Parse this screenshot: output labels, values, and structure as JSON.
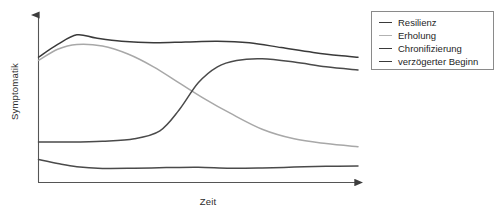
{
  "chart_data": {
    "type": "line",
    "title": "",
    "xlabel": "Zeit",
    "ylabel": "Symptomatik",
    "grid": false,
    "legend_position": "right-top",
    "axis_style": "arrow-axes-no-ticks",
    "xlim": [
      0,
      100
    ],
    "ylim": [
      0,
      100
    ],
    "series": [
      {
        "name": "Resilienz",
        "color": "#4a4a4a",
        "description": "low flat curve near baseline, slight decline then flat",
        "x": [
          0,
          6,
          12,
          20,
          30,
          40,
          50,
          60,
          70,
          80,
          90,
          100
        ],
        "y": [
          14,
          11.5,
          9.5,
          8.5,
          8.6,
          9.0,
          9.2,
          8.6,
          8.8,
          9.3,
          9.8,
          10.0
        ]
      },
      {
        "name": "Erholung",
        "color": "#a8a8a8",
        "description": "rises to early peak then steadily declines to low level",
        "x": [
          0,
          6,
          12,
          20,
          28,
          36,
          44,
          52,
          60,
          70,
          80,
          90,
          100
        ],
        "y": [
          76,
          83,
          86,
          85,
          80,
          72,
          62,
          52,
          43,
          33,
          27,
          24,
          22
        ]
      },
      {
        "name": "Chronifizierung",
        "color": "#3a3a3a",
        "description": "rises to high early peak and remains elevated with slight decline",
        "x": [
          0,
          6,
          12,
          18,
          26,
          36,
          46,
          56,
          66,
          76,
          86,
          94,
          100
        ],
        "y": [
          78,
          86,
          92,
          90,
          88,
          87,
          87.5,
          88,
          87,
          84,
          81,
          79,
          78
        ]
      },
      {
        "name": "verzögerter Beginn",
        "color": "#4a4a4a",
        "description": "flat low start, steep delayed rise, then high plateau with slight decline",
        "x": [
          0,
          10,
          20,
          30,
          38,
          44,
          50,
          56,
          62,
          70,
          80,
          90,
          100
        ],
        "y": [
          25,
          25,
          25.5,
          27,
          32,
          45,
          62,
          72,
          76,
          77,
          75,
          72,
          70
        ]
      }
    ]
  },
  "legend": {
    "items": [
      {
        "label": "Resilienz",
        "color": "#3a3a3a"
      },
      {
        "label": "Erholung",
        "color": "#b2b2b2"
      },
      {
        "label": "Chronifizierung",
        "color": "#3a3a3a"
      },
      {
        "label": "verzögerter Beginn",
        "color": "#3a3a3a"
      }
    ]
  },
  "axes": {
    "y_title": "Symptomatik",
    "x_title": "Zeit"
  },
  "colors": {
    "axis": "#555555",
    "dark_line": "#3a3a3a",
    "mid_line": "#4a4a4a",
    "light_line": "#a8a8a8",
    "legend_border": "#8a8a8a",
    "background": "#ffffff"
  }
}
